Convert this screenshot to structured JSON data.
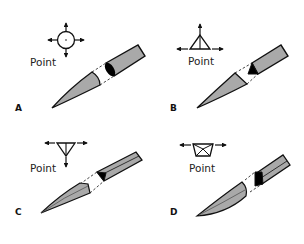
{
  "figure": {
    "title": "",
    "colors": {
      "stroke": "#111111",
      "blade_fill": "#a9a9a9",
      "blade_dark": "#7d7d7d",
      "section_fill": "#000000",
      "background": "#ffffff"
    },
    "panels": [
      {
        "id": "A",
        "label": "A",
        "icon": "circle-cross-section-icon",
        "icon_text": "Point",
        "arrows": [
          "up",
          "down",
          "left",
          "right"
        ]
      },
      {
        "id": "B",
        "label": "B",
        "icon": "triangle-cross-section-icon",
        "icon_text": "Point",
        "arrows": [
          "up",
          "left",
          "right"
        ]
      },
      {
        "id": "C",
        "label": "C",
        "icon": "inverted-triangle-cross-section-icon",
        "icon_text": "Point",
        "arrows": [
          "down",
          "left",
          "right"
        ]
      },
      {
        "id": "D",
        "label": "D",
        "icon": "trapezoid-cross-section-icon",
        "icon_text": "Point",
        "arrows": [
          "left",
          "right"
        ]
      }
    ]
  }
}
